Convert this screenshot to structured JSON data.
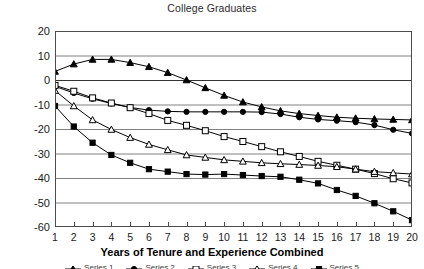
{
  "chart_data": {
    "type": "line",
    "title": "College Graduates",
    "xlabel": "Years of Tenure and Experience Combined",
    "ylabel": "",
    "xlim": [
      1,
      20
    ],
    "ylim": [
      -60,
      20
    ],
    "yticks": [
      20,
      10,
      0,
      -10,
      -20,
      -30,
      -40,
      -50,
      -60
    ],
    "xticks": [
      1,
      2,
      3,
      4,
      5,
      6,
      7,
      8,
      9,
      10,
      11,
      12,
      13,
      14,
      15,
      16,
      17,
      18,
      19,
      20
    ],
    "grid": true,
    "legend_position": "bottom",
    "x": [
      1,
      2,
      3,
      4,
      5,
      6,
      7,
      8,
      9,
      10,
      11,
      12,
      13,
      14,
      15,
      16,
      17,
      18,
      19,
      20
    ],
    "series": [
      {
        "name": "Series 1",
        "marker": "filled-triangle",
        "color": "#000000",
        "values": [
          3.5,
          6.5,
          8.4,
          8.4,
          7.1,
          5.4,
          3.0,
          0.0,
          -3.2,
          -6.3,
          -9.0,
          -11.0,
          -12.6,
          -13.7,
          -14.5,
          -15.2,
          -15.6,
          -15.9,
          -16.1,
          -16.3
        ]
      },
      {
        "name": "Series 2",
        "marker": "filled-circle",
        "color": "#000000",
        "values": [
          -2.6,
          -5.3,
          -7.7,
          -9.6,
          -11.2,
          -12.3,
          -12.8,
          -13.0,
          -13.0,
          -13.0,
          -13.0,
          -13.1,
          -13.9,
          -15.2,
          -16.1,
          -16.6,
          -17.2,
          -18.4,
          -20.3,
          -21.8
        ]
      },
      {
        "name": "Series 3",
        "marker": "open-square",
        "color": "#000000",
        "values": [
          -2.2,
          -4.6,
          -7.3,
          -9.4,
          -11.3,
          -13.7,
          -16.5,
          -18.5,
          -20.7,
          -23.1,
          -25.1,
          -27.2,
          -29.3,
          -31.2,
          -33.2,
          -34.8,
          -36.4,
          -38.2,
          -40.3,
          -42.0
        ]
      },
      {
        "name": "Series 4",
        "marker": "open-triangle",
        "color": "#000000",
        "values": [
          -4.3,
          -10.6,
          -16.3,
          -20.2,
          -23.5,
          -26.3,
          -28.5,
          -30.6,
          -31.6,
          -32.6,
          -33.2,
          -33.8,
          -34.2,
          -34.5,
          -34.9,
          -35.4,
          -36.4,
          -37.4,
          -37.9,
          -38.4
        ]
      },
      {
        "name": "Series 5",
        "marker": "filled-square",
        "color": "#000000",
        "values": [
          -10.6,
          -19.0,
          -25.6,
          -30.6,
          -33.8,
          -36.4,
          -37.4,
          -38.4,
          -38.6,
          -38.4,
          -38.8,
          -39.2,
          -39.5,
          -40.7,
          -42.2,
          -44.9,
          -47.3,
          -50.3,
          -53.6,
          -57.2
        ]
      }
    ],
    "legend_entries": [
      "Series 1",
      "Series 2",
      "Series 3",
      "Series 4",
      "Series 5"
    ]
  },
  "style": {
    "grid_color": "#808080",
    "axis_color": "#4d4d4d",
    "line_color": "#1a1a1a",
    "background": "#ffffff"
  }
}
